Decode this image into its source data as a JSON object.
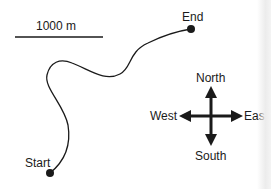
{
  "scale_bar": {
    "label": "1000 m"
  },
  "route": {
    "start_label": "Start",
    "end_label": "End"
  },
  "compass": {
    "north": "North",
    "south": "South",
    "west": "West",
    "east": "Eas"
  },
  "colors": {
    "ink": "#1a1a1a",
    "background": "#ffffff"
  }
}
